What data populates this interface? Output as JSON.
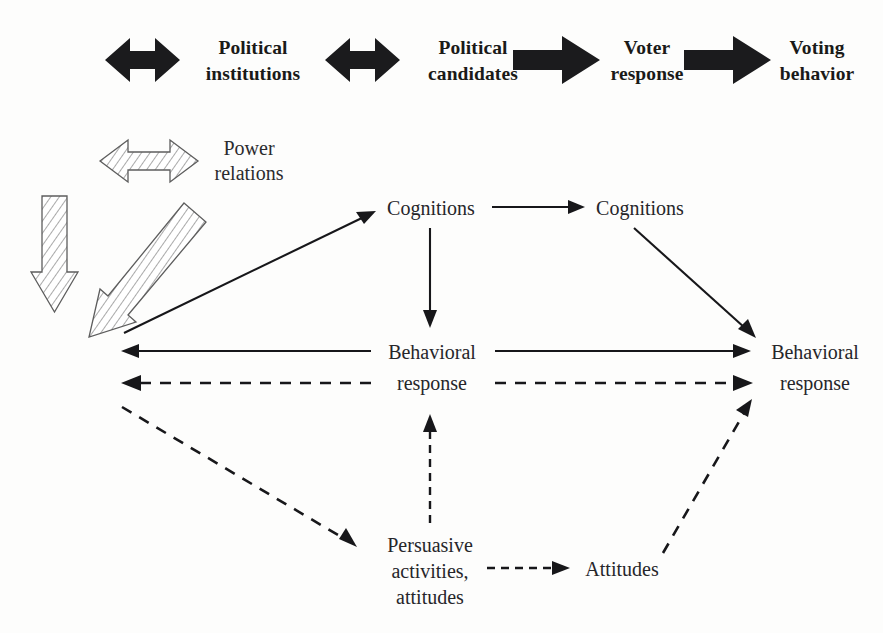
{
  "figure": {
    "type": "flow-diagram",
    "header_chain": {
      "items": [
        {
          "id": "political-institutions",
          "label_line1": "Political",
          "label_line2": "institutions"
        },
        {
          "id": "political-candidates",
          "label_line1": "Political",
          "label_line2": "candidates"
        },
        {
          "id": "voter-response",
          "label_line1": "Voter",
          "label_line2": "response"
        },
        {
          "id": "voting-behavior",
          "label_line1": "Voting",
          "label_line2": "behavior"
        }
      ],
      "connectors": [
        {
          "id": "connector-0",
          "style": "double-headed-block-arrow",
          "direction": "both"
        },
        {
          "id": "connector-1",
          "style": "double-headed-block-arrow",
          "direction": "both"
        },
        {
          "id": "connector-2",
          "style": "single-block-arrow",
          "direction": "right"
        },
        {
          "id": "connector-3",
          "style": "single-block-arrow",
          "direction": "right"
        }
      ]
    },
    "power_relations": {
      "label_line1": "Power",
      "label_line2": "relations",
      "arrows": [
        {
          "id": "power-relations-double-arrow",
          "style": "hatched-block-arrow",
          "direction": "both"
        },
        {
          "id": "power-relations-down-arrow",
          "style": "hatched-block-arrow",
          "direction": "down"
        },
        {
          "id": "power-relations-diagonal-arrow",
          "style": "hatched-block-arrow",
          "direction": "down-left"
        }
      ]
    },
    "nodes": [
      {
        "id": "cognitions-left",
        "label_line1": "Cognitions",
        "label_line2": ""
      },
      {
        "id": "cognitions-right",
        "label_line1": "Cognitions",
        "label_line2": ""
      },
      {
        "id": "behavioral-response-left",
        "label_line1": "Behavioral",
        "label_line2": "response"
      },
      {
        "id": "behavioral-response-right",
        "label_line1": "Behavioral",
        "label_line2": "response"
      },
      {
        "id": "persuasive-activities",
        "label_line1": "Persuasive",
        "label_line2": "activities,",
        "label_line3": "attitudes"
      },
      {
        "id": "attitudes",
        "label_line1": "Attitudes",
        "label_line2": ""
      }
    ],
    "edges": [
      {
        "id": "edge-left-to-cognitions",
        "from": "left-margin",
        "to": "cognitions-left",
        "style": "solid"
      },
      {
        "id": "edge-cognitions-to-cognitions",
        "from": "cognitions-left",
        "to": "cognitions-right",
        "style": "solid"
      },
      {
        "id": "edge-cognitions-to-behavioral",
        "from": "cognitions-left",
        "to": "behavioral-response-left",
        "style": "solid"
      },
      {
        "id": "edge-cognitions-right-to-behavioral-right",
        "from": "cognitions-right",
        "to": "behavioral-response-right",
        "style": "solid"
      },
      {
        "id": "edge-behavioral-to-left-margin",
        "from": "behavioral-response-left",
        "to": "left-margin",
        "style": "solid"
      },
      {
        "id": "edge-behavioral-to-behavioral",
        "from": "behavioral-response-left",
        "to": "behavioral-response-right",
        "style": "solid"
      },
      {
        "id": "edge-behavioral-dashed-to-left-margin",
        "from": "behavioral-response-left",
        "to": "left-margin",
        "style": "dashed"
      },
      {
        "id": "edge-behavioral-dashed-to-behavioral-right",
        "from": "behavioral-response-left",
        "to": "behavioral-response-right",
        "style": "dashed"
      },
      {
        "id": "edge-left-margin-to-persuasive",
        "from": "left-margin",
        "to": "persuasive-activities",
        "style": "dashed"
      },
      {
        "id": "edge-persuasive-to-behavioral",
        "from": "persuasive-activities",
        "to": "behavioral-response-left",
        "style": "dashed"
      },
      {
        "id": "edge-persuasive-to-attitudes",
        "from": "persuasive-activities",
        "to": "attitudes",
        "style": "dashed"
      },
      {
        "id": "edge-attitudes-to-behavioral-right",
        "from": "attitudes",
        "to": "behavioral-response-right",
        "style": "dashed"
      }
    ],
    "colors": {
      "ink": "#17171a",
      "hatch_stroke": "#5d5d5d",
      "block_arrow_fill": "#1b1b1d",
      "background": "#fdfdfc"
    }
  }
}
